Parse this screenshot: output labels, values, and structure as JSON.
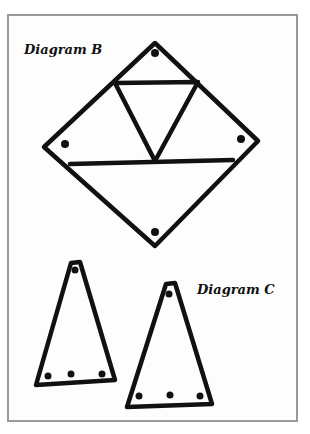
{
  "colors": {
    "frame": "#9a9a9a",
    "stroke": "#111111",
    "background": "#fdfdfd"
  },
  "diagram_b": {
    "label": "Diagram B",
    "shape": "square rotated 45° (diamond) divided into 4 triangles",
    "diamond": {
      "top": [
        155,
        43
      ],
      "right": [
        258,
        141
      ],
      "bottom": [
        155,
        246
      ],
      "left": [
        44,
        147
      ]
    },
    "dots": [
      [
        155,
        53
      ],
      [
        64,
        144
      ],
      [
        242,
        139
      ],
      [
        155,
        232
      ]
    ]
  },
  "diagram_c": {
    "label": "Diagram C",
    "shapes": "two tall isosceles triangles, each with 1 dot at apex and 3 dots along base",
    "triangle_1": {
      "apex": [
        75,
        262
      ],
      "base_left": [
        36,
        384
      ],
      "base_right": [
        115,
        380
      ],
      "dots": [
        [
          75,
          270
        ],
        [
          47,
          376
        ],
        [
          71,
          375
        ],
        [
          102,
          374
        ]
      ]
    },
    "triangle_2": {
      "apex": [
        170,
        283
      ],
      "base_left": [
        127,
        407
      ],
      "base_right": [
        212,
        404
      ],
      "dots": [
        [
          169,
          294
        ],
        [
          139,
          396
        ],
        [
          170,
          395
        ],
        [
          200,
          395
        ]
      ]
    }
  }
}
